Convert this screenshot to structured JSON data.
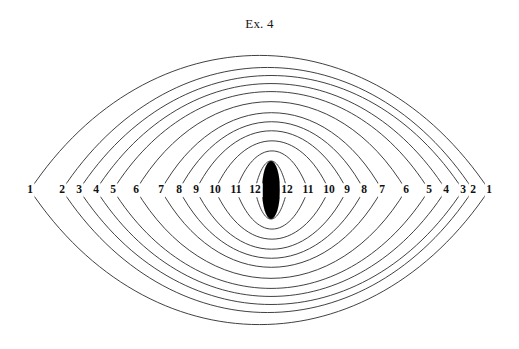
{
  "figure": {
    "title": "Ex. 4",
    "background_color": "#ffffff",
    "stroke_color": "#2b2b2b",
    "label_color": "#111111",
    "width": 519,
    "height": 349
  },
  "geometry": {
    "center_x": 259.5,
    "center_y": 190,
    "half_span": 229.5,
    "outer_half_height": 134,
    "curve_count": 12,
    "innermost_half_width": 9,
    "innermost_half_height": 29
  },
  "axis_labels_left": [
    {
      "text": "1",
      "x": 30,
      "y": 190
    },
    {
      "text": "2",
      "x": 62,
      "y": 190
    },
    {
      "text": "3",
      "x": 79,
      "y": 190
    },
    {
      "text": "4",
      "x": 96,
      "y": 190
    },
    {
      "text": "5",
      "x": 113,
      "y": 190
    },
    {
      "text": "6",
      "x": 136,
      "y": 190
    },
    {
      "text": "7",
      "x": 161,
      "y": 190
    },
    {
      "text": "8",
      "x": 179,
      "y": 190
    },
    {
      "text": "9",
      "x": 196,
      "y": 190
    },
    {
      "text": "10",
      "x": 215,
      "y": 190
    },
    {
      "text": "11",
      "x": 236,
      "y": 190
    },
    {
      "text": "12",
      "x": 255,
      "y": 190
    }
  ],
  "axis_labels_right": [
    {
      "text": "12",
      "x": 287,
      "y": 190
    },
    {
      "text": "11",
      "x": 308,
      "y": 190
    },
    {
      "text": "10",
      "x": 329,
      "y": 190
    },
    {
      "text": "9",
      "x": 347,
      "y": 190
    },
    {
      "text": "8",
      "x": 364,
      "y": 190
    },
    {
      "text": "7",
      "x": 382,
      "y": 190
    },
    {
      "text": "6",
      "x": 406,
      "y": 190
    },
    {
      "text": "5",
      "x": 429,
      "y": 190
    },
    {
      "text": "4",
      "x": 446,
      "y": 190
    },
    {
      "text": "3",
      "x": 463,
      "y": 190
    },
    {
      "text": "2",
      "x": 473,
      "y": 190
    },
    {
      "text": "1",
      "x": 489,
      "y": 190
    }
  ],
  "chart_data": {
    "type": "line",
    "title": "Ex. 4",
    "xlabel": "",
    "ylabel": "",
    "grid": false,
    "legend": null,
    "x": [
      30,
      62,
      79,
      96,
      113,
      136,
      161,
      179,
      196,
      215,
      236,
      255
    ],
    "series": [
      {
        "name": "1",
        "left_x": 30,
        "right_x": 489,
        "half_height": 134
      },
      {
        "name": "2",
        "left_x": 62,
        "right_x": 473,
        "half_height": 122
      },
      {
        "name": "3",
        "left_x": 79,
        "right_x": 463,
        "half_height": 114
      },
      {
        "name": "4",
        "left_x": 96,
        "right_x": 446,
        "half_height": 106
      },
      {
        "name": "5",
        "left_x": 113,
        "right_x": 429,
        "half_height": 98
      },
      {
        "name": "6",
        "left_x": 136,
        "right_x": 406,
        "half_height": 88
      },
      {
        "name": "7",
        "left_x": 161,
        "right_x": 382,
        "half_height": 77
      },
      {
        "name": "8",
        "left_x": 179,
        "right_x": 364,
        "half_height": 68
      },
      {
        "name": "9",
        "left_x": 196,
        "right_x": 347,
        "half_height": 59
      },
      {
        "name": "10",
        "left_x": 215,
        "right_x": 329,
        "half_height": 49
      },
      {
        "name": "11",
        "left_x": 236,
        "right_x": 308,
        "half_height": 39
      },
      {
        "name": "12",
        "left_x": 255,
        "right_x": 287,
        "half_height": 29
      }
    ],
    "xlim": [
      30,
      489
    ],
    "ylim": [
      56,
      324
    ]
  }
}
